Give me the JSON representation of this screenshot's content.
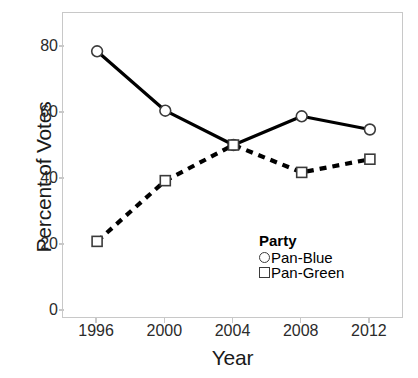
{
  "chart_data": {
    "type": "line",
    "title": "",
    "xlabel": "Year",
    "ylabel": "Percent of Votes",
    "categories": [
      "1996",
      "2000",
      "2004",
      "2008",
      "2012"
    ],
    "x": [
      1996,
      2000,
      2004,
      2008,
      2012
    ],
    "xlim": [
      1994,
      2014
    ],
    "ylim": [
      0,
      90
    ],
    "yticks": [
      "0",
      "20",
      "40",
      "60",
      "80"
    ],
    "ytick_values": [
      0,
      20,
      40,
      60,
      80
    ],
    "grid": false,
    "legend_position": "inside-lower-right",
    "legend_title": "Party",
    "series": [
      {
        "name": "Pan-Blue",
        "values": [
          78.7,
          60.7,
          50.3,
          59.0,
          55.0
        ],
        "marker": "open-circle",
        "linestyle": "solid",
        "color": "#000000"
      },
      {
        "name": "Pan-Green",
        "values": [
          21.1,
          39.5,
          50.3,
          42.0,
          46.0
        ],
        "marker": "open-square",
        "linestyle": "dashed",
        "color": "#000000"
      }
    ]
  },
  "axes": {
    "y_title": "Percent of Votes",
    "x_title": "Year"
  },
  "legend": {
    "title": "Party",
    "entries": [
      {
        "label": "Pan-Blue",
        "marker": "circle-marker-icon"
      },
      {
        "label": "Pan-Green",
        "marker": "square-marker-icon"
      }
    ]
  },
  "colors": {
    "background": "#ffffff",
    "frame": "#c8c8c8",
    "line": "#000000",
    "marker_edge": "#3b3b3b",
    "marker_fill": "#ffffff",
    "text": "#1a1a1a"
  }
}
